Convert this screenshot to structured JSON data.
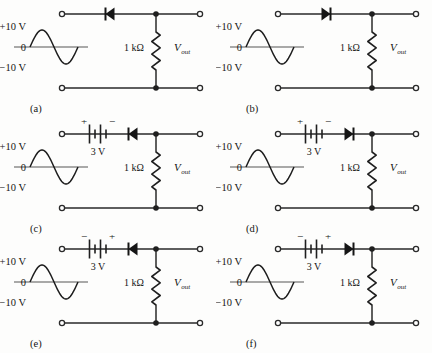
{
  "figure": {
    "type": "circuit-diagram",
    "background_color": "#fdfdfc",
    "line_color": "#2a2a2a",
    "columns": 2,
    "rows": 3
  },
  "common": {
    "source_top_label": "+10 V",
    "source_mid_label": "0",
    "source_bottom_label": "−10 V",
    "resistor_label": "1 kΩ",
    "output_label_main": "V",
    "output_label_sub": "out",
    "battery_label": "3 V",
    "plus_sign": "+",
    "minus_sign": "−"
  },
  "waveform": {
    "type": "sine",
    "cycles": 1,
    "amplitude_volts": 10,
    "peak_positive": 10,
    "peak_negative": -10,
    "starts": "positive"
  },
  "circuits": [
    {
      "id": "a",
      "caption": "(a)",
      "has_battery": false,
      "battery_voltage": null,
      "battery_left_sign": null,
      "battery_right_sign": null,
      "diode_direction": "left",
      "resistor": "1 kΩ",
      "output": "Vout"
    },
    {
      "id": "b",
      "caption": "(b)",
      "has_battery": false,
      "battery_voltage": null,
      "battery_left_sign": null,
      "battery_right_sign": null,
      "diode_direction": "right",
      "resistor": "1 kΩ",
      "output": "Vout"
    },
    {
      "id": "c",
      "caption": "(c)",
      "has_battery": true,
      "battery_voltage": "3 V",
      "battery_left_sign": "+",
      "battery_right_sign": "−",
      "diode_direction": "left",
      "resistor": "1 kΩ",
      "output": "Vout"
    },
    {
      "id": "d",
      "caption": "(d)",
      "has_battery": true,
      "battery_voltage": "3 V",
      "battery_left_sign": "+",
      "battery_right_sign": "−",
      "diode_direction": "right",
      "resistor": "1 kΩ",
      "output": "Vout"
    },
    {
      "id": "e",
      "caption": "(e)",
      "has_battery": true,
      "battery_voltage": "3 V",
      "battery_left_sign": "−",
      "battery_right_sign": "+",
      "diode_direction": "left",
      "resistor": "1 kΩ",
      "output": "Vout"
    },
    {
      "id": "f",
      "caption": "(f)",
      "has_battery": true,
      "battery_voltage": "3 V",
      "battery_left_sign": "−",
      "battery_right_sign": "+",
      "diode_direction": "right",
      "resistor": "1 kΩ",
      "output": "Vout"
    }
  ]
}
